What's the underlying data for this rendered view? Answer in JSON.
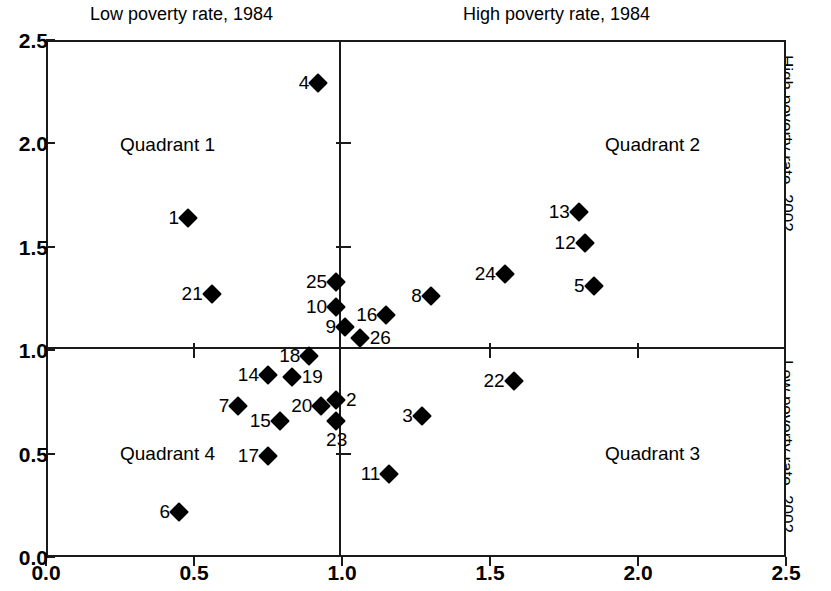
{
  "chart_data": {
    "type": "scatter",
    "title": "",
    "top_labels": {
      "left": "Low poverty rate, 1984",
      "right": "High poverty rate, 1984"
    },
    "right_labels": {
      "upper": "High poverty rate, 2002",
      "lower": "Low poverty rate, 2002"
    },
    "xlabel": "",
    "ylabel": "",
    "xlim": [
      0.0,
      2.5
    ],
    "ylim": [
      0.0,
      2.5
    ],
    "xticks": [
      "0.0",
      "0.5",
      "1.0",
      "1.5",
      "2.0",
      "2.5"
    ],
    "xtick_values": [
      0.0,
      0.5,
      1.0,
      1.5,
      2.0,
      2.5
    ],
    "yticks": [
      "0.0",
      "0.5",
      "1.0",
      "1.5",
      "2.0",
      "2.5"
    ],
    "ytick_values": [
      0.0,
      0.5,
      1.0,
      1.5,
      2.0,
      2.5
    ],
    "grid": false,
    "legend": null,
    "reference_lines": {
      "vertical_x": 1.0,
      "horizontal_y": 1.0
    },
    "quadrants": [
      {
        "name": "Quadrant 1",
        "x": 0.25,
        "y": 1.99
      },
      {
        "name": "Quadrant 2",
        "x": 2.21,
        "y": 1.99
      },
      {
        "name": "Quadrant 3",
        "x": 2.21,
        "y": 0.5
      },
      {
        "name": "Quadrant 4",
        "x": 0.25,
        "y": 0.5
      }
    ],
    "point_label_field": "label",
    "points": [
      {
        "label": "1",
        "x": 0.48,
        "y": 1.64,
        "label_pos": "left"
      },
      {
        "label": "2",
        "x": 0.98,
        "y": 0.76,
        "label_pos": "right"
      },
      {
        "label": "3",
        "x": 1.27,
        "y": 0.68,
        "label_pos": "left"
      },
      {
        "label": "4",
        "x": 0.92,
        "y": 2.29,
        "label_pos": "left"
      },
      {
        "label": "5",
        "x": 1.85,
        "y": 1.31,
        "label_pos": "left"
      },
      {
        "label": "6",
        "x": 0.45,
        "y": 0.22,
        "label_pos": "left"
      },
      {
        "label": "7",
        "x": 0.65,
        "y": 0.73,
        "label_pos": "left"
      },
      {
        "label": "8",
        "x": 1.3,
        "y": 1.26,
        "label_pos": "left"
      },
      {
        "label": "9",
        "x": 1.01,
        "y": 1.11,
        "label_pos": "left"
      },
      {
        "label": "10",
        "x": 0.98,
        "y": 1.21,
        "label_pos": "left"
      },
      {
        "label": "11",
        "x": 1.16,
        "y": 0.4,
        "label_pos": "left"
      },
      {
        "label": "12",
        "x": 1.82,
        "y": 1.52,
        "label_pos": "left"
      },
      {
        "label": "13",
        "x": 1.8,
        "y": 1.67,
        "label_pos": "left"
      },
      {
        "label": "14",
        "x": 0.75,
        "y": 0.88,
        "label_pos": "left"
      },
      {
        "label": "15",
        "x": 0.79,
        "y": 0.66,
        "label_pos": "left"
      },
      {
        "label": "16",
        "x": 1.15,
        "y": 1.17,
        "label_pos": "left"
      },
      {
        "label": "17",
        "x": 0.75,
        "y": 0.49,
        "label_pos": "left"
      },
      {
        "label": "18",
        "x": 0.89,
        "y": 0.97,
        "label_pos": "left"
      },
      {
        "label": "19",
        "x": 0.83,
        "y": 0.87,
        "label_pos": "right"
      },
      {
        "label": "20",
        "x": 0.93,
        "y": 0.73,
        "label_pos": "left"
      },
      {
        "label": "21",
        "x": 0.56,
        "y": 1.27,
        "label_pos": "left"
      },
      {
        "label": "22",
        "x": 1.58,
        "y": 0.85,
        "label_pos": "left"
      },
      {
        "label": "23",
        "x": 0.98,
        "y": 0.66,
        "label_pos": "below"
      },
      {
        "label": "24",
        "x": 1.55,
        "y": 1.37,
        "label_pos": "left"
      },
      {
        "label": "25",
        "x": 0.98,
        "y": 1.33,
        "label_pos": "left"
      },
      {
        "label": "26",
        "x": 1.06,
        "y": 1.06,
        "label_pos": "right"
      }
    ]
  }
}
